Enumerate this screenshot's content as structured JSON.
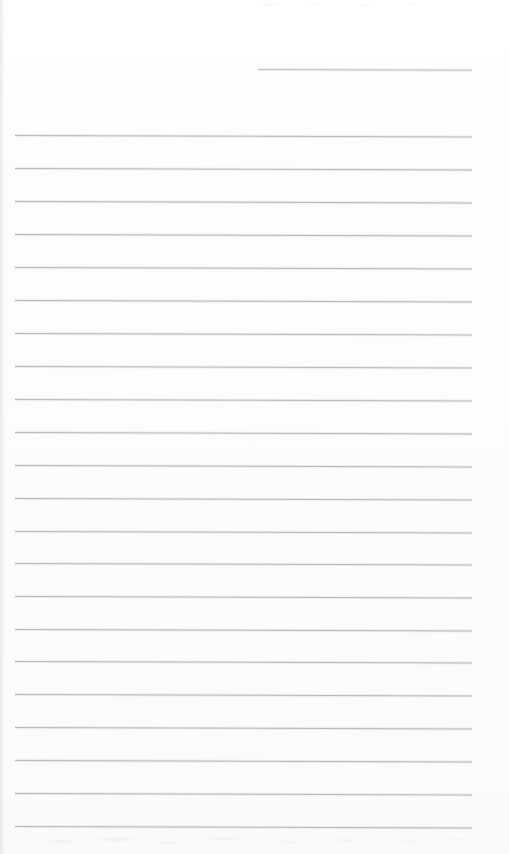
{
  "document": {
    "kind": "scanned-blank-lined-page",
    "title": "",
    "body_text": "",
    "page_number": "",
    "colors": {
      "page_background": "#fdfdfd",
      "rule_line": "#b9babe",
      "header_rule_line": "#c2c3c7",
      "scan_edge_shadow": "#96989e"
    }
  },
  "page": {
    "width": 509,
    "height": 854
  },
  "ruling": {
    "left_margin_x": 15,
    "right_margin_x": 472,
    "first_line_y": 135,
    "line_spacing": 33.05,
    "line_count": 22,
    "slope_deg": 0.18,
    "lines": [
      {
        "index": 1,
        "y": 135,
        "x1": 15,
        "x2": 472
      },
      {
        "index": 2,
        "y": 168,
        "x1": 15,
        "x2": 472
      },
      {
        "index": 3,
        "y": 201,
        "x1": 15,
        "x2": 472
      },
      {
        "index": 4,
        "y": 234,
        "x1": 15,
        "x2": 472
      },
      {
        "index": 5,
        "y": 267,
        "x1": 15,
        "x2": 472
      },
      {
        "index": 6,
        "y": 300,
        "x1": 15,
        "x2": 472
      },
      {
        "index": 7,
        "y": 333,
        "x1": 15,
        "x2": 472
      },
      {
        "index": 8,
        "y": 366,
        "x1": 15,
        "x2": 472
      },
      {
        "index": 9,
        "y": 399,
        "x1": 15,
        "x2": 472
      },
      {
        "index": 10,
        "y": 432,
        "x1": 15,
        "x2": 472
      },
      {
        "index": 11,
        "y": 465,
        "x1": 15,
        "x2": 472
      },
      {
        "index": 12,
        "y": 498,
        "x1": 15,
        "x2": 472
      },
      {
        "index": 13,
        "y": 531,
        "x1": 15,
        "x2": 472
      },
      {
        "index": 14,
        "y": 563,
        "x1": 15,
        "x2": 472
      },
      {
        "index": 15,
        "y": 596,
        "x1": 15,
        "x2": 472
      },
      {
        "index": 16,
        "y": 629,
        "x1": 15,
        "x2": 472
      },
      {
        "index": 17,
        "y": 661,
        "x1": 15,
        "x2": 472
      },
      {
        "index": 18,
        "y": 694,
        "x1": 15,
        "x2": 472
      },
      {
        "index": 19,
        "y": 727,
        "x1": 15,
        "x2": 472
      },
      {
        "index": 20,
        "y": 760,
        "x1": 15,
        "x2": 472
      },
      {
        "index": 21,
        "y": 793,
        "x1": 15,
        "x2": 472
      },
      {
        "index": 22,
        "y": 826,
        "x1": 15,
        "x2": 472
      }
    ],
    "header_line": {
      "label": "short-header-rule",
      "y": 69,
      "x1": 258,
      "x2": 472
    }
  },
  "artifacts": {
    "left_edge_shadow": true,
    "top_edge_noise": true,
    "bottom_edge_noise": true
  }
}
